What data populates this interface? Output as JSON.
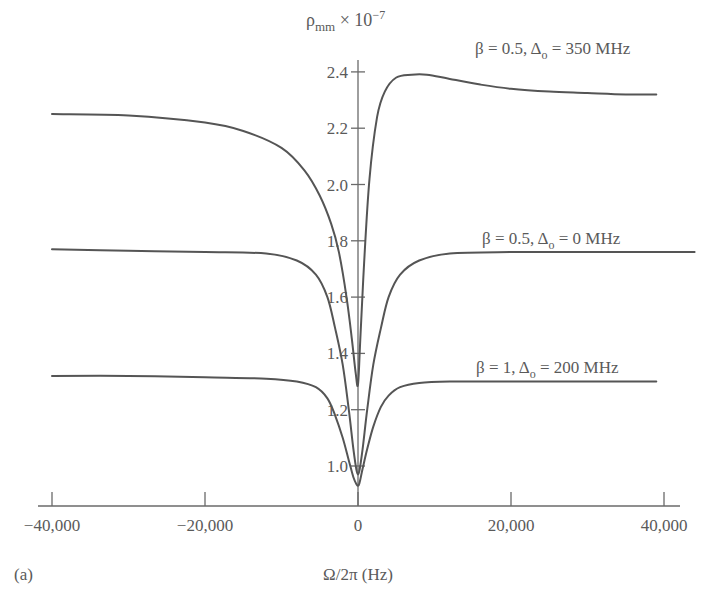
{
  "chart_data": {
    "type": "line",
    "title": "",
    "panel_label": "(a)",
    "xlabel": "Ω/2π (Hz)",
    "ylabel": "ρ_mm × 10^−7",
    "ylabel_parts": {
      "rho": "ρ",
      "sub": "mm",
      "times": " × 10",
      "sup": "−7"
    },
    "xlim": [
      -42000,
      44000
    ],
    "ylim": [
      0.88,
      2.48
    ],
    "xticks": [
      -40000,
      -20000,
      0,
      20000,
      40000
    ],
    "xtick_labels": [
      "−40,000",
      "−20,000",
      "0",
      "20,000",
      "40,000"
    ],
    "yticks": [
      1.0,
      1.2,
      1.4,
      1.6,
      1.8,
      2.0,
      2.2,
      2.4
    ],
    "ytick_labels": [
      "1.0",
      "1.2",
      "1.4",
      "1.6",
      "1.8",
      "2.0",
      "2.2",
      "2.4"
    ],
    "grid": false,
    "legend": "inline labels",
    "series": [
      {
        "name": "β = 0.5, Δo = 350 MHz",
        "label_parts": {
          "beta": "β = 0.5, Δ",
          "sub": "o",
          "rest": " = 350 MHz"
        },
        "x": [
          -40000,
          -30000,
          -20000,
          -15000,
          -10000,
          -7000,
          -5000,
          -3500,
          -2500,
          -1500,
          -800,
          -300,
          0,
          300,
          800,
          1500,
          2500,
          3500,
          5000,
          7000,
          9000,
          12000,
          16000,
          20000,
          25000,
          30000,
          35000,
          39000
        ],
        "y": [
          2.25,
          2.245,
          2.22,
          2.19,
          2.13,
          2.05,
          1.96,
          1.86,
          1.76,
          1.6,
          1.45,
          1.33,
          1.29,
          1.45,
          1.72,
          2.02,
          2.24,
          2.33,
          2.38,
          2.39,
          2.39,
          2.375,
          2.355,
          2.34,
          2.33,
          2.325,
          2.32,
          2.32
        ]
      },
      {
        "name": "β = 0.5, Δo = 0 MHz",
        "label_parts": {
          "beta": "β = 0.5, Δ",
          "sub": "o",
          "rest": " = 0 MHz"
        },
        "x": [
          -40000,
          -30000,
          -20000,
          -12000,
          -8000,
          -5500,
          -4000,
          -3000,
          -2000,
          -1200,
          -600,
          -200,
          0,
          200,
          600,
          1200,
          2000,
          3000,
          4000,
          5500,
          8000,
          12000,
          20000,
          30000,
          38000,
          44000
        ],
        "y": [
          1.77,
          1.765,
          1.76,
          1.755,
          1.73,
          1.68,
          1.6,
          1.49,
          1.36,
          1.2,
          1.06,
          0.985,
          0.97,
          0.985,
          1.06,
          1.2,
          1.36,
          1.49,
          1.6,
          1.68,
          1.73,
          1.755,
          1.76,
          1.76,
          1.76,
          1.76
        ]
      },
      {
        "name": "β = 1, Δo = 200 MHz",
        "label_parts": {
          "beta": "β = 1, Δ",
          "sub": "o",
          "rest": " = 200 MHz"
        },
        "x": [
          -40000,
          -30000,
          -20000,
          -12000,
          -8000,
          -5500,
          -4000,
          -3000,
          -2000,
          -1200,
          -600,
          -200,
          0,
          200,
          600,
          1200,
          2000,
          3000,
          4000,
          5500,
          8000,
          12000,
          20000,
          30000,
          39000
        ],
        "y": [
          1.32,
          1.32,
          1.315,
          1.31,
          1.3,
          1.28,
          1.24,
          1.18,
          1.1,
          1.02,
          0.96,
          0.935,
          0.93,
          0.94,
          0.99,
          1.06,
          1.14,
          1.21,
          1.25,
          1.28,
          1.295,
          1.3,
          1.3,
          1.3,
          1.3
        ]
      }
    ]
  },
  "layout": {
    "axis_origin_px": {
      "x": 358,
      "y": 506
    },
    "x_px_per_unit": 0.00765,
    "y_px_per_unit": 281.5,
    "y_zero_value": 1.0,
    "y_zero_px": 466,
    "x_axis_px_range": [
      38,
      680
    ],
    "y_axis_px_top": 60
  }
}
